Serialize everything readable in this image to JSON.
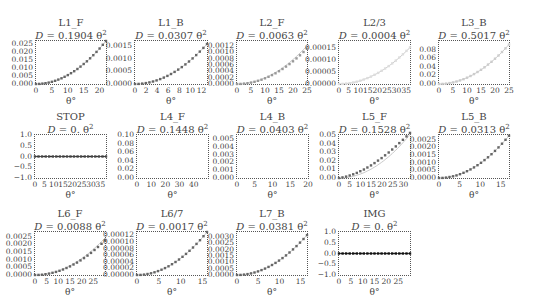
{
  "chart_data": [
    {
      "type": "scatter",
      "title": "L1_F",
      "subtitle": "D = 0.1904 θ²",
      "coef": "0.1904",
      "xlabel": "θ°",
      "xlim": [
        0,
        22
      ],
      "ylim": [
        0,
        0.027
      ],
      "xticks": [
        "0",
        "5",
        "10",
        "15",
        "20"
      ],
      "xtick_vals": [
        0,
        5,
        10,
        15,
        20
      ],
      "yticks": [
        "0.000",
        "0.005",
        "0.010",
        "0.015",
        "0.020",
        "0.025"
      ],
      "ytick_vals": [
        0,
        0.005,
        0.01,
        0.015,
        0.02,
        0.025
      ],
      "points_x": [
        0,
        1,
        2,
        3,
        4,
        5,
        6,
        7,
        8,
        9,
        10,
        11,
        12,
        13,
        14,
        15,
        16,
        17,
        18,
        19,
        20,
        21,
        22
      ],
      "fit_k": 5.58e-05,
      "data_k": 5.58e-05,
      "shade": "#666"
    },
    {
      "type": "scatter",
      "title": "L1_B",
      "subtitle": "D = 0.0307 θ²",
      "coef": "0.0307",
      "xlabel": "θ°",
      "xlim": [
        0,
        13
      ],
      "ylim": [
        0,
        0.0017
      ],
      "xticks": [
        "0",
        "2",
        "4",
        "6",
        "8",
        "10",
        "12"
      ],
      "xtick_vals": [
        0,
        2,
        4,
        6,
        8,
        10,
        12
      ],
      "yticks": [
        "0.0000",
        "0.0005",
        "0.0010",
        "0.0015"
      ],
      "ytick_vals": [
        0,
        0.0005,
        0.001,
        0.0015
      ],
      "points_x": [
        0,
        0.65,
        1.3,
        1.95,
        2.6,
        3.25,
        3.9,
        4.55,
        5.2,
        5.85,
        6.5,
        7.15,
        7.8,
        8.45,
        9.1,
        9.75,
        10.4,
        11.05,
        11.7,
        12.35,
        13
      ],
      "fit_k": 9.35e-06,
      "data_k": 9.35e-06,
      "shade": "#666"
    },
    {
      "type": "scatter",
      "title": "L2_F",
      "subtitle": "D = 0.0063 θ²",
      "coef": "0.0063",
      "xlabel": "θ°",
      "xlim": [
        0,
        25
      ],
      "ylim": [
        0,
        0.00135
      ],
      "xticks": [
        "0",
        "5",
        "10",
        "15",
        "20",
        "25"
      ],
      "xtick_vals": [
        0,
        5,
        10,
        15,
        20,
        25
      ],
      "yticks": [
        "0.0000",
        "0.0002",
        "0.0004",
        "0.0006",
        "0.0008",
        "0.0010",
        "0.0012"
      ],
      "ytick_vals": [
        0,
        0.0002,
        0.0004,
        0.0006,
        0.0008,
        0.001,
        0.0012
      ],
      "points_x": [
        0,
        1.25,
        2.5,
        3.75,
        5,
        6.25,
        7.5,
        8.75,
        10,
        11.25,
        12.5,
        13.75,
        15,
        16.25,
        17.5,
        18.75,
        20,
        21.25,
        22.5,
        23.75,
        25
      ],
      "fit_k": 1.92e-06,
      "data_k": 1.78e-06,
      "shade": "#999"
    },
    {
      "type": "scatter",
      "title": "L2/3",
      "subtitle": "D = 0.0004 θ²",
      "coef": "0.0004",
      "xlabel": "θ°",
      "xlim": [
        0,
        37
      ],
      "ylim": [
        0,
        0.00018
      ],
      "xticks": [
        "0",
        "5",
        "10",
        "15",
        "20",
        "25",
        "30",
        "35"
      ],
      "xtick_vals": [
        0,
        5,
        10,
        15,
        20,
        25,
        30,
        35
      ],
      "yticks": [
        "0.00000",
        "0.00005",
        "0.00010",
        "0.00015"
      ],
      "ytick_vals": [
        0,
        5e-05,
        0.0001,
        0.00015
      ],
      "points_x": [
        0,
        1.85,
        3.7,
        5.55,
        7.4,
        9.25,
        11.1,
        12.95,
        14.8,
        16.65,
        18.5,
        20.35,
        22.2,
        24.05,
        25.9,
        27.75,
        29.6,
        31.45,
        33.3,
        35.15,
        37
      ],
      "fit_k": 1.12e-07,
      "data_k": 1.12e-07,
      "shade": "#ddd"
    },
    {
      "type": "scatter",
      "title": "L3_B",
      "subtitle": "D = 0.5017 θ²",
      "coef": "0.5017",
      "xlabel": "θ°",
      "xlim": [
        0,
        25
      ],
      "ylim": [
        0,
        0.1
      ],
      "xticks": [
        "0",
        "5",
        "10",
        "15",
        "20",
        "25"
      ],
      "xtick_vals": [
        0,
        5,
        10,
        15,
        20,
        25
      ],
      "yticks": [
        "0.00",
        "0.02",
        "0.04",
        "0.06",
        "0.08"
      ],
      "ytick_vals": [
        0,
        0.02,
        0.04,
        0.06,
        0.08
      ],
      "points_x": [
        0,
        1.25,
        2.5,
        3.75,
        5,
        6.25,
        7.5,
        8.75,
        10,
        11.25,
        12.5,
        13.75,
        15,
        16.25,
        17.5,
        18.75,
        20,
        21.25,
        22.5,
        23.75,
        25
      ],
      "fit_k": 0.000147,
      "data_k": 0.000147,
      "shade": "#ccc"
    },
    {
      "type": "scatter",
      "title": "STOP",
      "subtitle": "D = 0. θ²",
      "coef": "0.",
      "xlabel": "θ°",
      "xlim": [
        0,
        38
      ],
      "ylim": [
        -1,
        1
      ],
      "xticks": [
        "0",
        "5",
        "10",
        "15",
        "20",
        "25",
        "30",
        "35"
      ],
      "xtick_vals": [
        0,
        5,
        10,
        15,
        20,
        25,
        30,
        35
      ],
      "yticks": [
        "−1.0",
        "−0.5",
        "0.0",
        "0.5",
        "1.0"
      ],
      "ytick_vals": [
        -1,
        -0.5,
        0,
        0.5,
        1
      ],
      "points_x": [
        0,
        1.9,
        3.8,
        5.7,
        7.6,
        9.5,
        11.4,
        13.3,
        15.2,
        17.1,
        19,
        20.9,
        22.8,
        24.7,
        26.6,
        28.5,
        30.4,
        32.3,
        34.2,
        36.1,
        38
      ],
      "fit_k": 0,
      "data_k": 0,
      "shade": "#444"
    },
    {
      "type": "scatter",
      "title": "L4_F",
      "subtitle": "D = 0.1448 θ²",
      "coef": "0.1448",
      "xlabel": "θ°",
      "xlim": [
        0,
        50
      ],
      "ylim": [
        0,
        0.1
      ],
      "xticks": [
        "0",
        "10",
        "20",
        "30",
        "40"
      ],
      "xtick_vals": [
        0,
        10,
        20,
        30,
        40
      ],
      "yticks": [
        "0.00",
        "0.02",
        "0.04",
        "0.06",
        "0.08",
        "0.10"
      ],
      "ytick_vals": [
        0,
        0.02,
        0.04,
        0.06,
        0.08,
        0.1
      ],
      "points_x": [],
      "fit_k": 0,
      "data_k": 0,
      "shade": "#fff"
    },
    {
      "type": "scatter",
      "title": "L4_B",
      "subtitle": "D = 0.0403 θ²",
      "coef": "0.0403",
      "xlabel": "θ°",
      "xlim": [
        0,
        20
      ],
      "ylim": [
        0,
        0.0055
      ],
      "xticks": [
        "0",
        "5",
        "10",
        "15",
        "20"
      ],
      "xtick_vals": [
        0,
        5,
        10,
        15,
        20
      ],
      "yticks": [
        "0.000",
        "0.001",
        "0.002",
        "0.003",
        "0.004",
        "0.005"
      ],
      "ytick_vals": [
        0,
        0.001,
        0.002,
        0.003,
        0.004,
        0.005
      ],
      "points_x": [],
      "fit_k": 0,
      "data_k": 0,
      "shade": "#fff"
    },
    {
      "type": "scatter",
      "title": "L5_F",
      "subtitle": "D = 0.1528 θ²",
      "coef": "0.1528",
      "xlabel": "θ°",
      "xlim": [
        0,
        33
      ],
      "ylim": [
        0,
        0.05
      ],
      "xticks": [
        "0",
        "5",
        "10",
        "15",
        "20",
        "25",
        "30"
      ],
      "xtick_vals": [
        0,
        5,
        10,
        15,
        20,
        25,
        30
      ],
      "yticks": [
        "0.00",
        "0.01",
        "0.02",
        "0.03",
        "0.04",
        "0.05"
      ],
      "ytick_vals": [
        0,
        0.01,
        0.02,
        0.03,
        0.04,
        0.05
      ],
      "points_x": [
        0,
        1.65,
        3.3,
        4.95,
        6.6,
        8.25,
        9.9,
        11.55,
        13.2,
        14.85,
        16.5,
        18.15,
        19.8,
        21.45,
        23.1,
        24.75,
        26.4,
        28.05,
        29.7,
        31.35,
        33
      ],
      "fit_k": 4.65e-05,
      "data_k": "curved",
      "shade": "#666"
    },
    {
      "type": "scatter",
      "title": "L5_B",
      "subtitle": "D = 0.0313 θ²",
      "coef": "0.0313",
      "xlabel": "θ°",
      "xlim": [
        0,
        17
      ],
      "ylim": [
        0,
        0.0028
      ],
      "xticks": [
        "0",
        "5",
        "10",
        "15"
      ],
      "xtick_vals": [
        0,
        5,
        10,
        15
      ],
      "yticks": [
        "0.0000",
        "0.0005",
        "0.0010",
        "0.0015",
        "0.0020",
        "0.0025"
      ],
      "ytick_vals": [
        0,
        0.0005,
        0.001,
        0.0015,
        0.002,
        0.0025
      ],
      "points_x": [
        0,
        0.85,
        1.7,
        2.55,
        3.4,
        4.25,
        5.1,
        5.95,
        6.8,
        7.65,
        8.5,
        9.35,
        10.2,
        11.05,
        11.9,
        12.75,
        13.6,
        14.45,
        15.3,
        16.15,
        17
      ],
      "fit_k": 9.53e-06,
      "data_k": 9.53e-06,
      "shade": "#666"
    },
    {
      "type": "scatter",
      "title": "L6_F",
      "subtitle": "D = 0.0088 θ²",
      "coef": "0.0088",
      "xlabel": "θ°",
      "xlim": [
        0,
        30
      ],
      "ylim": [
        0,
        0.0028
      ],
      "xticks": [
        "0",
        "5",
        "10",
        "15",
        "20",
        "25"
      ],
      "xtick_vals": [
        0,
        5,
        10,
        15,
        20,
        25
      ],
      "yticks": [
        "0.0000",
        "0.0005",
        "0.0010",
        "0.0015",
        "0.0020",
        "0.0025"
      ],
      "ytick_vals": [
        0,
        0.0005,
        0.001,
        0.0015,
        0.002,
        0.0025
      ],
      "points_x": [
        0,
        1.5,
        3,
        4.5,
        6,
        7.5,
        9,
        10.5,
        12,
        13.5,
        15,
        16.5,
        18,
        19.5,
        21,
        22.5,
        24,
        25.5,
        27,
        28.5,
        30
      ],
      "fit_k": 2.68e-06,
      "data_k": 2.5e-06,
      "shade": "#666"
    },
    {
      "type": "scatter",
      "title": "L6/7",
      "subtitle": "D = 0.0017 θ²",
      "coef": "0.0017",
      "xlabel": "θ°",
      "xlim": [
        0,
        16
      ],
      "ylim": [
        0,
        0.00013
      ],
      "xticks": [
        "0",
        "5",
        "10",
        "15"
      ],
      "xtick_vals": [
        0,
        5,
        10,
        15
      ],
      "yticks": [
        "0.00000",
        "0.00002",
        "0.00004",
        "0.00006",
        "0.00008",
        "0.00010",
        "0.00012"
      ],
      "ytick_vals": [
        0,
        2e-05,
        4e-05,
        6e-05,
        8e-05,
        0.0001,
        0.00012
      ],
      "points_x": [
        0,
        0.8,
        1.6,
        2.4,
        3.2,
        4,
        4.8,
        5.6,
        6.4,
        7.2,
        8,
        8.8,
        9.6,
        10.4,
        11.2,
        12,
        12.8,
        13.6,
        14.4,
        15.2,
        16
      ],
      "fit_k": 5.08e-07,
      "data_k": 5.08e-07,
      "shade": "#666"
    },
    {
      "type": "scatter",
      "title": "L7_B",
      "subtitle": "D = 0.0381 θ²",
      "coef": "0.0381",
      "xlabel": "θ°",
      "xlim": [
        0,
        16.5
      ],
      "ylim": [
        0,
        0.0034
      ],
      "xticks": [
        "0",
        "5",
        "10",
        "15"
      ],
      "xtick_vals": [
        0,
        5,
        10,
        15
      ],
      "yticks": [
        "0.0000",
        "0.0005",
        "0.0010",
        "0.0015",
        "0.0020",
        "0.0025",
        "0.0030"
      ],
      "ytick_vals": [
        0,
        0.0005,
        0.001,
        0.0015,
        0.002,
        0.0025,
        0.003
      ],
      "points_x": [
        0,
        0.825,
        1.65,
        2.475,
        3.3,
        4.125,
        4.95,
        5.775,
        6.6,
        7.425,
        8.25,
        9.075,
        9.9,
        10.725,
        11.55,
        12.375,
        13.2,
        14.025,
        14.85,
        15.675,
        16.5
      ],
      "fit_k": 1.16e-05,
      "data_k": 1.16e-05,
      "shade": "#666"
    },
    {
      "type": "scatter",
      "title": "IMG",
      "subtitle": "D = 0. θ²",
      "coef": "0.",
      "xlabel": "θ°",
      "xlim": [
        0,
        30
      ],
      "ylim": [
        -1,
        1
      ],
      "xticks": [
        "0",
        "5",
        "10",
        "15",
        "20",
        "25"
      ],
      "xtick_vals": [
        0,
        5,
        10,
        15,
        20,
        25
      ],
      "yticks": [
        "−1.0",
        "−0.5",
        "0.0",
        "0.5",
        "1.0"
      ],
      "ytick_vals": [
        -1,
        -0.5,
        0,
        0.5,
        1
      ],
      "points_x": [
        0,
        1.5,
        3,
        4.5,
        6,
        7.5,
        9,
        10.5,
        12,
        13.5,
        15,
        16.5,
        18,
        19.5,
        21,
        22.5,
        24,
        25.5,
        27,
        28.5,
        30
      ],
      "fit_k": 0,
      "data_k": 0,
      "shade": "#111"
    }
  ],
  "layout": {
    "panels": [
      {
        "x": 35,
        "y": 40,
        "w": 72,
        "h": 45
      },
      {
        "x": 134,
        "y": 40,
        "w": 74,
        "h": 45
      },
      {
        "x": 236,
        "y": 40,
        "w": 72,
        "h": 45
      },
      {
        "x": 338,
        "y": 40,
        "w": 73,
        "h": 45
      },
      {
        "x": 438,
        "y": 40,
        "w": 72,
        "h": 45
      },
      {
        "x": 34,
        "y": 134,
        "w": 73,
        "h": 45
      },
      {
        "x": 136,
        "y": 134,
        "w": 73,
        "h": 45
      },
      {
        "x": 236,
        "y": 134,
        "w": 73,
        "h": 45
      },
      {
        "x": 338,
        "y": 134,
        "w": 73,
        "h": 45
      },
      {
        "x": 438,
        "y": 134,
        "w": 72,
        "h": 45
      },
      {
        "x": 34,
        "y": 231,
        "w": 72,
        "h": 45
      },
      {
        "x": 136,
        "y": 231,
        "w": 72,
        "h": 45
      },
      {
        "x": 236,
        "y": 231,
        "w": 72,
        "h": 45
      },
      {
        "x": 338,
        "y": 231,
        "w": 73,
        "h": 45
      }
    ]
  }
}
